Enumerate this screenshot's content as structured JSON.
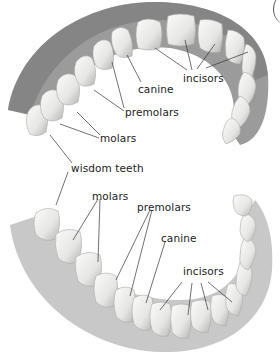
{
  "diagram": {
    "upper_jaw": {
      "labels": [
        {
          "id": "incisors",
          "text": "incisors",
          "x": 183,
          "y": 73
        },
        {
          "id": "canine",
          "text": "canine",
          "x": 138,
          "y": 84
        },
        {
          "id": "premolars",
          "text": "premolars",
          "x": 125,
          "y": 107
        },
        {
          "id": "molars",
          "text": "molars",
          "x": 100,
          "y": 133
        },
        {
          "id": "wisdom-teeth",
          "text": "wisdom teeth",
          "x": 71,
          "y": 163
        }
      ]
    },
    "lower_jaw": {
      "labels": [
        {
          "id": "molars",
          "text": "molars",
          "x": 92,
          "y": 191
        },
        {
          "id": "premolars",
          "text": "premolars",
          "x": 137,
          "y": 202
        },
        {
          "id": "canine",
          "text": "canine",
          "x": 161,
          "y": 233
        },
        {
          "id": "incisors",
          "text": "incisors",
          "x": 183,
          "y": 266
        }
      ]
    },
    "colors": {
      "tooth": "#f2f2f0",
      "tooth_shadow": "#b9b9b7",
      "gum": "#8d8d8d",
      "line": "#333333",
      "text": "#222222"
    }
  }
}
